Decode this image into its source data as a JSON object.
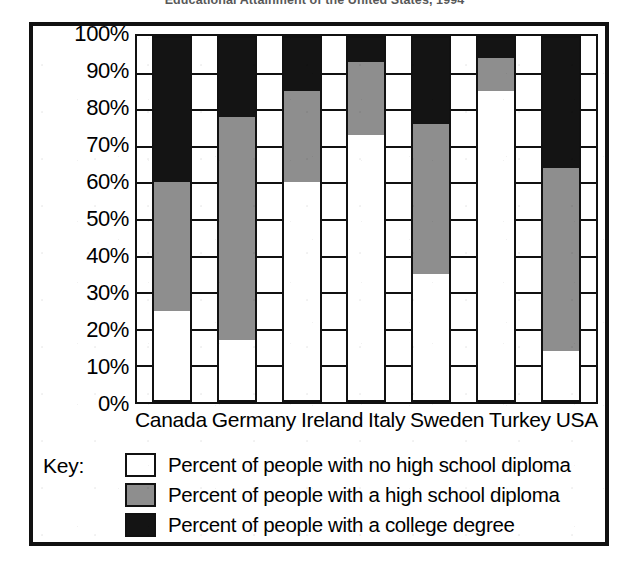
{
  "figure": {
    "title_fragment": "Educational Attainment of the United States, 1994",
    "key_label": "Key:"
  },
  "chart_data": {
    "type": "bar",
    "subtype": "stacked-bar-100-percent",
    "title": "Educational Attainment of the United States, 1994",
    "xlabel": "",
    "ylabel": "",
    "ylim": [
      0,
      100
    ],
    "grid": true,
    "legend_position": "below",
    "categories": [
      "Canada",
      "Germany",
      "Ireland",
      "Italy",
      "Sweden",
      "Turkey",
      "USA"
    ],
    "y_ticks": [
      "0%",
      "10%",
      "20%",
      "30%",
      "40%",
      "50%",
      "60%",
      "70%",
      "80%",
      "90%",
      "100%"
    ],
    "series": [
      {
        "name": "Percent of people with no high school diploma",
        "color": "#ffffff",
        "swatch": "white",
        "values": [
          25,
          17,
          60,
          73,
          35,
          85,
          14
        ]
      },
      {
        "name": "Percent of people with a high school diploma",
        "color": "#8e8e8e",
        "swatch": "gray",
        "values": [
          35,
          61,
          25,
          20,
          41,
          9,
          50
        ]
      },
      {
        "name": "Percent of people with a college degree",
        "color": "#141414",
        "swatch": "black",
        "values": [
          40,
          22,
          15,
          7,
          24,
          6,
          36
        ]
      }
    ],
    "cumulative_tops": {
      "no_diploma": [
        25,
        17,
        60,
        73,
        35,
        85,
        14
      ],
      "hs_diploma": [
        60,
        78,
        85,
        93,
        76,
        94,
        64
      ],
      "college": [
        100,
        100,
        100,
        100,
        100,
        100,
        100
      ]
    }
  }
}
